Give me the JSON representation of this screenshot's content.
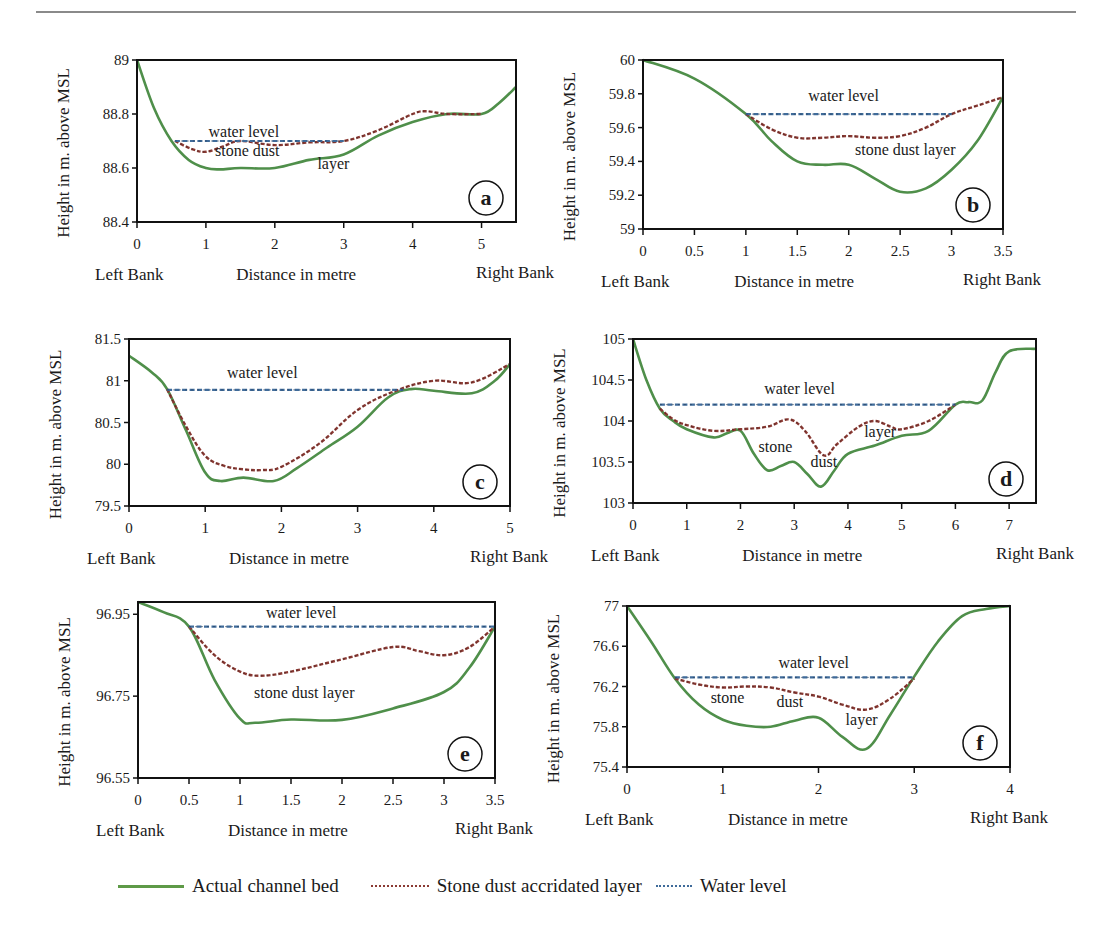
{
  "figure": {
    "legend": [
      {
        "label": "Actual channel bed",
        "style": "solid",
        "color": "#4f8f4a"
      },
      {
        "label": "Stone dust accridated layer",
        "style": "dotted",
        "color": "#8b3a34"
      },
      {
        "label": "Water level",
        "style": "dotted",
        "color": "#3f6b9a"
      }
    ]
  },
  "chart_data": [
    {
      "id": "a",
      "type": "line",
      "panel_label": "a",
      "xlabel": "Distance in metre",
      "ylabel": "Height in m. above MSL",
      "left_bank_label": "Left Bank",
      "right_bank_label": "Right Bank",
      "xlim": [
        0,
        5.5
      ],
      "ylim": [
        88.4,
        89.0
      ],
      "xticks": [
        0,
        1,
        2,
        3,
        4,
        5
      ],
      "xtick_labels": [
        "0",
        "1",
        "2",
        "3",
        "4",
        "5"
      ],
      "yticks": [
        88.4,
        88.6,
        88.8,
        89.0
      ],
      "ytick_labels": [
        "88.4",
        "88.6",
        "88.8",
        "89"
      ],
      "annotations": [
        {
          "text": "water level",
          "x": 1.55,
          "y": 88.715
        },
        {
          "text": "stone dust",
          "x": 1.6,
          "y": 88.645
        },
        {
          "text": "layer",
          "x": 2.85,
          "y": 88.595
        }
      ],
      "series": [
        {
          "name": "Actual channel bed",
          "x": [
            0,
            0.25,
            0.5,
            0.75,
            1.0,
            1.2,
            1.5,
            2.0,
            2.5,
            3.0,
            3.5,
            4.0,
            4.5,
            5.0,
            5.25,
            5.5
          ],
          "y": [
            89.0,
            88.82,
            88.7,
            88.63,
            88.6,
            88.595,
            88.6,
            88.6,
            88.63,
            88.65,
            88.72,
            88.77,
            88.8,
            88.8,
            88.84,
            88.9
          ]
        },
        {
          "name": "Stone dust accridated layer",
          "x": [
            0.55,
            0.8,
            1.0,
            1.25,
            1.5,
            2.0,
            2.5,
            3.0,
            3.5,
            4.0,
            4.2,
            4.5,
            5.0
          ],
          "y": [
            88.7,
            88.67,
            88.66,
            88.68,
            88.7,
            88.685,
            88.695,
            88.7,
            88.74,
            88.8,
            88.81,
            88.8,
            88.8
          ]
        },
        {
          "name": "Water level",
          "x": [
            0.55,
            3.0
          ],
          "y": [
            88.7,
            88.7
          ]
        }
      ]
    },
    {
      "id": "b",
      "type": "line",
      "panel_label": "b",
      "xlabel": "Distance in metre",
      "ylabel": "Height in m. above MSL",
      "left_bank_label": "Left Bank",
      "right_bank_label": "Right Bank",
      "xlim": [
        0,
        3.5
      ],
      "ylim": [
        59.0,
        60.0
      ],
      "xticks": [
        0,
        0.5,
        1,
        1.5,
        2,
        2.5,
        3,
        3.5
      ],
      "xtick_labels": [
        "0",
        "0.5",
        "1",
        "1.5",
        "2",
        "2.5",
        "3",
        "3.5"
      ],
      "yticks": [
        59.0,
        59.2,
        59.4,
        59.6,
        59.8,
        60.0
      ],
      "ytick_labels": [
        "59",
        "59.2",
        "59.4",
        "59.6",
        "59.8",
        "60"
      ],
      "annotations": [
        {
          "text": "water level",
          "x": 1.95,
          "y": 59.76
        },
        {
          "text": "stone dust layer",
          "x": 2.55,
          "y": 59.44
        }
      ],
      "series": [
        {
          "name": "Actual channel bed",
          "x": [
            0,
            0.5,
            1.0,
            1.25,
            1.5,
            1.75,
            2.0,
            2.25,
            2.5,
            2.75,
            3.0,
            3.25,
            3.5
          ],
          "y": [
            60.0,
            59.89,
            59.68,
            59.52,
            59.4,
            59.38,
            59.38,
            59.3,
            59.22,
            59.24,
            59.35,
            59.52,
            59.78
          ]
        },
        {
          "name": "Stone dust accridated layer",
          "x": [
            1.0,
            1.25,
            1.5,
            1.75,
            2.0,
            2.25,
            2.5,
            2.75,
            3.0,
            3.25,
            3.5
          ],
          "y": [
            59.68,
            59.59,
            59.54,
            59.54,
            59.55,
            59.54,
            59.55,
            59.6,
            59.68,
            59.73,
            59.78
          ]
        },
        {
          "name": "Water level",
          "x": [
            1.0,
            3.0
          ],
          "y": [
            59.68,
            59.68
          ]
        }
      ]
    },
    {
      "id": "c",
      "type": "line",
      "panel_label": "c",
      "xlabel": "Distance in metre",
      "ylabel": "Height in m. above MSL",
      "left_bank_label": "Left Bank",
      "right_bank_label": "Right Bank",
      "xlim": [
        0,
        5
      ],
      "ylim": [
        79.5,
        81.5
      ],
      "xticks": [
        0,
        1,
        2,
        3,
        4,
        5
      ],
      "xtick_labels": [
        "0",
        "1",
        "2",
        "3",
        "4",
        "5"
      ],
      "yticks": [
        79.5,
        80.0,
        80.5,
        81.0,
        81.5
      ],
      "ytick_labels": [
        "79.5",
        "80",
        "80.5",
        "81",
        "81.5"
      ],
      "annotations": [
        {
          "text": "water level",
          "x": 1.75,
          "y": 81.03
        }
      ],
      "series": [
        {
          "name": "Actual channel bed",
          "x": [
            0,
            0.3,
            0.5,
            0.75,
            1.0,
            1.2,
            1.5,
            1.9,
            2.2,
            2.6,
            3.0,
            3.4,
            3.7,
            4.0,
            4.5,
            4.8,
            5.0
          ],
          "y": [
            81.3,
            81.1,
            80.9,
            80.4,
            79.9,
            79.8,
            79.84,
            79.8,
            79.95,
            80.2,
            80.45,
            80.8,
            80.9,
            80.88,
            80.85,
            81.0,
            81.2
          ]
        },
        {
          "name": "Stone dust accridated layer",
          "x": [
            0.5,
            0.75,
            1.0,
            1.25,
            1.5,
            1.75,
            2.0,
            2.5,
            3.0,
            3.5,
            4.0,
            4.5,
            5.0
          ],
          "y": [
            80.9,
            80.45,
            80.1,
            79.98,
            79.94,
            79.93,
            79.97,
            80.25,
            80.65,
            80.88,
            81.0,
            80.98,
            81.2
          ]
        },
        {
          "name": "Water level",
          "x": [
            0.5,
            3.6
          ],
          "y": [
            80.89,
            80.89
          ]
        }
      ]
    },
    {
      "id": "d",
      "type": "line",
      "panel_label": "d",
      "xlabel": "Distance in metre",
      "ylabel": "Height in m. above MSL",
      "left_bank_label": "Left Bank",
      "right_bank_label": "Right Bank",
      "xlim": [
        0,
        7.5
      ],
      "ylim": [
        103.0,
        105.0
      ],
      "xticks": [
        0,
        1,
        2,
        3,
        4,
        5,
        6,
        7
      ],
      "xtick_labels": [
        "0",
        "1",
        "2",
        "3",
        "4",
        "5",
        "6",
        "7"
      ],
      "yticks": [
        103.0,
        103.5,
        104.0,
        104.5,
        105.0
      ],
      "ytick_labels": [
        "103",
        "103.5",
        "104",
        "104.5",
        "105"
      ],
      "annotations": [
        {
          "text": "water level",
          "x": 3.1,
          "y": 104.33
        },
        {
          "text": "stone",
          "x": 2.65,
          "y": 103.62
        },
        {
          "text": "dust",
          "x": 3.55,
          "y": 103.44
        },
        {
          "text": "layer",
          "x": 4.6,
          "y": 103.8
        }
      ],
      "series": [
        {
          "name": "Actual channel bed",
          "x": [
            0,
            0.25,
            0.5,
            0.75,
            1.0,
            1.5,
            1.75,
            2.0,
            2.25,
            2.5,
            2.75,
            3.0,
            3.25,
            3.5,
            3.75,
            4.0,
            4.5,
            5.0,
            5.5,
            6.0,
            6.25,
            6.5,
            6.75,
            7.0,
            7.5
          ],
          "y": [
            105.0,
            104.5,
            104.15,
            104.0,
            103.9,
            103.8,
            103.85,
            103.88,
            103.6,
            103.4,
            103.45,
            103.5,
            103.35,
            103.2,
            103.4,
            103.6,
            103.7,
            103.82,
            103.88,
            104.2,
            104.23,
            104.25,
            104.6,
            104.85,
            104.88
          ]
        },
        {
          "name": "Stone dust accridated layer",
          "x": [
            0.5,
            0.75,
            1.0,
            1.5,
            2.0,
            2.5,
            2.9,
            3.2,
            3.55,
            3.8,
            4.2,
            4.5,
            4.8,
            5.0,
            5.5,
            6.0
          ],
          "y": [
            104.15,
            104.02,
            103.95,
            103.88,
            103.9,
            103.93,
            104.02,
            103.88,
            103.58,
            103.72,
            103.93,
            104.0,
            103.93,
            103.9,
            104.0,
            104.2
          ]
        },
        {
          "name": "Water level",
          "x": [
            0.5,
            6.0
          ],
          "y": [
            104.2,
            104.2
          ]
        }
      ]
    },
    {
      "id": "e",
      "type": "line",
      "panel_label": "e",
      "xlabel": "Distance in metre",
      "ylabel": "Height in m. above MSL",
      "left_bank_label": "Left Bank",
      "right_bank_label": "Right Bank",
      "xlim": [
        0,
        3.5
      ],
      "ylim": [
        96.55,
        96.98
      ],
      "xticks": [
        0,
        0.5,
        1,
        1.5,
        2,
        2.5,
        3,
        3.5
      ],
      "xtick_labels": [
        "0",
        "0.5",
        "1",
        "1.5",
        "2",
        "2.5",
        "3",
        "3.5"
      ],
      "yticks": [
        96.55,
        96.75,
        96.95
      ],
      "ytick_labels": [
        "96.55",
        "96.75",
        "96.95"
      ],
      "annotations": [
        {
          "text": "water level",
          "x": 1.6,
          "y": 96.94
        },
        {
          "text": "stone dust layer",
          "x": 1.63,
          "y": 96.745
        }
      ],
      "series": [
        {
          "name": "Actual channel bed",
          "x": [
            0,
            0.25,
            0.5,
            0.75,
            1.0,
            1.15,
            1.5,
            2.0,
            2.5,
            3.0,
            3.25,
            3.5
          ],
          "y": [
            96.98,
            96.955,
            96.92,
            96.79,
            96.695,
            96.685,
            96.693,
            96.692,
            96.72,
            96.76,
            96.82,
            96.92
          ]
        },
        {
          "name": "Stone dust accridated layer",
          "x": [
            0.5,
            0.75,
            1.0,
            1.2,
            1.5,
            2.0,
            2.5,
            2.75,
            3.0,
            3.25,
            3.5
          ],
          "y": [
            96.92,
            96.85,
            96.81,
            96.8,
            96.81,
            96.84,
            96.87,
            96.86,
            96.85,
            96.87,
            96.92
          ]
        },
        {
          "name": "Water level",
          "x": [
            0.5,
            3.5
          ],
          "y": [
            96.92,
            96.92
          ]
        }
      ]
    },
    {
      "id": "f",
      "type": "line",
      "panel_label": "f",
      "xlabel": "Distance in metre",
      "ylabel": "Height in m. above MSL",
      "left_bank_label": "Left Bank",
      "right_bank_label": "Right Bank",
      "xlim": [
        0,
        4
      ],
      "ylim": [
        75.4,
        77.0
      ],
      "xticks": [
        0,
        1,
        2,
        3,
        4
      ],
      "xtick_labels": [
        "0",
        "1",
        "2",
        "3",
        "4"
      ],
      "yticks": [
        75.4,
        75.8,
        76.2,
        76.6,
        77.0
      ],
      "ytick_labels": [
        "75.4",
        "75.8",
        "76.2",
        "76.6",
        "77"
      ],
      "annotations": [
        {
          "text": "water level",
          "x": 1.95,
          "y": 76.38
        },
        {
          "text": "stone",
          "x": 1.05,
          "y": 76.04
        },
        {
          "text": "dust",
          "x": 1.7,
          "y": 76.0
        },
        {
          "text": "layer",
          "x": 2.45,
          "y": 75.82
        }
      ],
      "series": [
        {
          "name": "Actual channel bed",
          "x": [
            0,
            0.25,
            0.5,
            0.75,
            1.0,
            1.25,
            1.5,
            1.75,
            2.0,
            2.25,
            2.5,
            2.75,
            3.0,
            3.25,
            3.5,
            3.75,
            4.0
          ],
          "y": [
            77.0,
            76.65,
            76.28,
            76.02,
            75.87,
            75.81,
            75.8,
            75.86,
            75.89,
            75.7,
            75.58,
            75.92,
            76.3,
            76.65,
            76.9,
            76.97,
            77.0
          ]
        },
        {
          "name": "Stone dust accridated layer",
          "x": [
            0.5,
            0.75,
            1.0,
            1.25,
            1.5,
            1.75,
            2.0,
            2.25,
            2.5,
            2.75,
            3.0
          ],
          "y": [
            76.28,
            76.22,
            76.19,
            76.2,
            76.19,
            76.14,
            76.1,
            76.02,
            75.97,
            76.08,
            76.28
          ]
        },
        {
          "name": "Water level",
          "x": [
            0.5,
            3.0
          ],
          "y": [
            76.29,
            76.29
          ]
        }
      ]
    }
  ]
}
